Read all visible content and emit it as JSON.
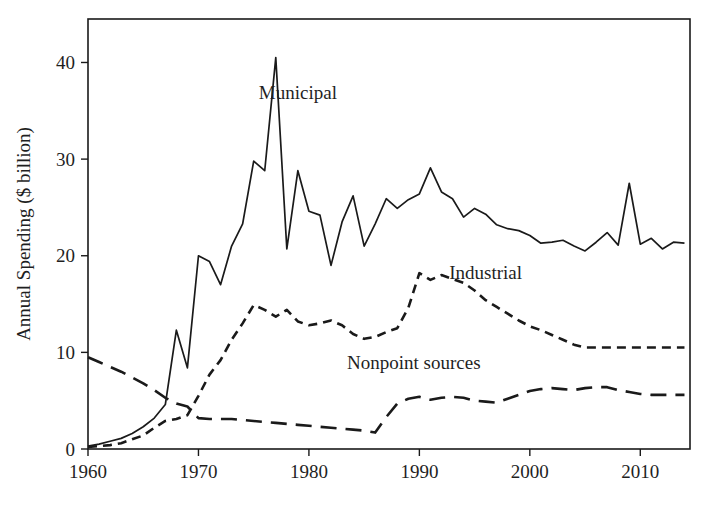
{
  "chart_data": {
    "type": "line",
    "title": "",
    "xlabel": "",
    "ylabel": "Annual Spending ($ billion)",
    "xlim": [
      1960,
      2014.5
    ],
    "ylim": [
      0,
      44.5
    ],
    "xticks": [
      1960,
      1970,
      1980,
      1990,
      2000,
      2010
    ],
    "xtick_labels": [
      "1960",
      "1970",
      "1980",
      "1990",
      "2000",
      "2010"
    ],
    "yticks": [
      0,
      10,
      20,
      30,
      40
    ],
    "ytick_labels": [
      "0",
      "10",
      "20",
      "30",
      "40"
    ],
    "grid": false,
    "legend_position": "inline-annotations",
    "frame": "box",
    "line_color": "#1a1a1a",
    "series": [
      {
        "name": "Municipal",
        "style": "solid",
        "label_x": 1979,
        "label_y": 36.2,
        "x": [
          1960,
          1961,
          1962,
          1963,
          1964,
          1965,
          1966,
          1967,
          1968,
          1969,
          1970,
          1971,
          1972,
          1973,
          1974,
          1975,
          1976,
          1977,
          1978,
          1979,
          1980,
          1981,
          1982,
          1983,
          1984,
          1985,
          1986,
          1987,
          1988,
          1989,
          1990,
          1991,
          1992,
          1993,
          1994,
          1995,
          1996,
          1997,
          1998,
          1999,
          2000,
          2001,
          2002,
          2003,
          2004,
          2005,
          2006,
          2007,
          2008,
          2009,
          2010,
          2011,
          2012,
          2013,
          2014
        ],
        "values": [
          0.3,
          0.5,
          0.8,
          1.1,
          1.6,
          2.3,
          3.2,
          4.6,
          12.3,
          8.4,
          20.0,
          19.4,
          17.0,
          21.0,
          23.3,
          29.8,
          28.8,
          40.5,
          20.7,
          28.8,
          24.6,
          24.2,
          19.0,
          23.5,
          26.2,
          21.0,
          23.3,
          25.9,
          24.9,
          25.8,
          26.4,
          29.1,
          26.6,
          25.9,
          24.0,
          24.9,
          24.3,
          23.2,
          22.8,
          22.6,
          22.1,
          21.3,
          21.4,
          21.6,
          21.0,
          20.5,
          21.4,
          22.4,
          21.1,
          27.5,
          21.2,
          21.8,
          20.7,
          21.4,
          21.3
        ]
      },
      {
        "name": "Industrial",
        "style": "dashed",
        "label_x": 1996,
        "label_y": 17.6,
        "x": [
          1960,
          1961,
          1962,
          1963,
          1964,
          1965,
          1966,
          1967,
          1968,
          1969,
          1970,
          1971,
          1972,
          1973,
          1974,
          1975,
          1976,
          1977,
          1978,
          1979,
          1980,
          1981,
          1982,
          1983,
          1984,
          1985,
          1986,
          1987,
          1988,
          1989,
          1990,
          1991,
          1992,
          1993,
          1994,
          1995,
          1996,
          1997,
          1998,
          1999,
          2000,
          2001,
          2002,
          2003,
          2004,
          2005,
          2006,
          2007,
          2008,
          2009,
          2010,
          2011,
          2012,
          2013,
          2014
        ],
        "values": [
          0.2,
          0.3,
          0.4,
          0.6,
          1.0,
          1.4,
          2.2,
          2.9,
          3.1,
          3.5,
          5.5,
          7.7,
          9.2,
          11.3,
          13.0,
          14.9,
          14.4,
          13.7,
          14.4,
          13.2,
          12.8,
          13.0,
          13.3,
          12.8,
          11.9,
          11.4,
          11.6,
          12.1,
          12.5,
          14.6,
          18.2,
          17.5,
          18.0,
          17.6,
          17.2,
          16.4,
          15.4,
          14.7,
          14.0,
          13.3,
          12.7,
          12.3,
          11.8,
          11.3,
          10.8,
          10.5,
          10.5,
          10.5,
          10.5,
          10.5,
          10.5,
          10.5,
          10.5,
          10.5,
          10.5
        ]
      },
      {
        "name": "Nonpoint sources",
        "style": "longdash",
        "label_x": 1989.5,
        "label_y": 8.3,
        "x": [
          1960,
          1961,
          1962,
          1963,
          1964,
          1965,
          1966,
          1967,
          1968,
          1969,
          1970,
          1971,
          1972,
          1973,
          1974,
          1975,
          1976,
          1977,
          1978,
          1979,
          1980,
          1981,
          1982,
          1983,
          1984,
          1985,
          1986,
          1987,
          1988,
          1989,
          1990,
          1991,
          1992,
          1993,
          1994,
          1995,
          1996,
          1997,
          1998,
          1999,
          2000,
          2001,
          2002,
          2003,
          2004,
          2005,
          2006,
          2007,
          2008,
          2009,
          2010,
          2011,
          2012,
          2013,
          2014
        ],
        "values": [
          9.5,
          9.0,
          8.5,
          8.0,
          7.4,
          6.8,
          6.1,
          5.3,
          4.7,
          4.4,
          3.2,
          3.1,
          3.1,
          3.1,
          3.0,
          2.9,
          2.8,
          2.7,
          2.6,
          2.5,
          2.4,
          2.3,
          2.2,
          2.1,
          2.0,
          1.9,
          1.7,
          3.3,
          4.7,
          5.2,
          5.4,
          5.1,
          5.3,
          5.4,
          5.3,
          5.0,
          4.9,
          4.8,
          5.2,
          5.6,
          6.0,
          6.2,
          6.3,
          6.2,
          6.1,
          6.3,
          6.4,
          6.4,
          6.1,
          5.9,
          5.7,
          5.6,
          5.6,
          5.6,
          5.6
        ]
      }
    ]
  }
}
